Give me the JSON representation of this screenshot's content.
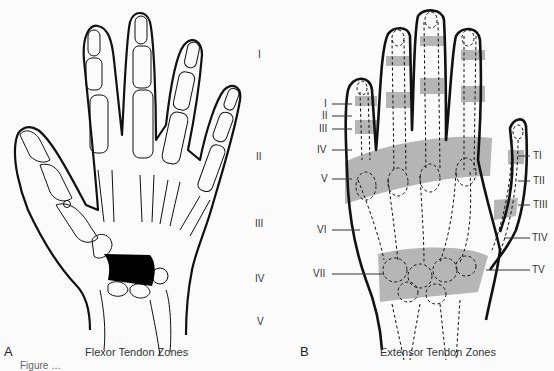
{
  "panel_a": {
    "letter": "A",
    "caption": "Flexor Tendon Zones",
    "zones": [
      "I",
      "II",
      "III",
      "IV",
      "V"
    ]
  },
  "panel_b": {
    "letter": "B",
    "caption": "Extensor Tendon Zones",
    "finger_zones": [
      "I",
      "II",
      "III",
      "IV",
      "V",
      "VI",
      "VII"
    ],
    "thumb_zones": [
      "TI",
      "TII",
      "TIII",
      "TIV",
      "TV"
    ]
  },
  "figure_caption_cut": "Figure …",
  "colors": {
    "outline": "#111111",
    "shade": "#a9a9a9",
    "fill_dark": "#000000"
  }
}
